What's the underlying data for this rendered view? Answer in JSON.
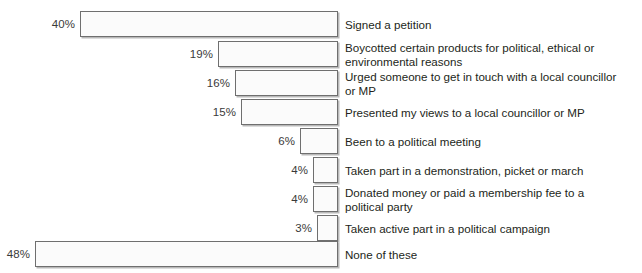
{
  "chart_data": {
    "type": "bar",
    "orientation": "horizontal",
    "title": "",
    "subtitle": "",
    "xlabel": "",
    "ylabel": "",
    "grid": false,
    "legend": false,
    "value_suffix": "%",
    "xlim": [
      0,
      48
    ],
    "categories": [
      "Signed a petition",
      "Boycotted certain products for political, ethical or\nenvironmental reasons",
      "Urged someone to get in touch with a local councillor\nor MP",
      "Presented my views to a local councillor or MP",
      "Been to a political meeting",
      "Taken part in a demonstration, picket or march",
      "Donated money or paid a membership fee to a\npolitical party",
      "Taken active part in a political campaign",
      "None of these"
    ],
    "values": [
      40,
      19,
      16,
      15,
      6,
      4,
      4,
      3,
      48
    ],
    "value_labels": [
      "40%",
      "19%",
      "16%",
      "15%",
      "6%",
      "4%",
      "4%",
      "3%",
      "48%"
    ],
    "bars": [
      {
        "label": "Signed a petition",
        "value": 40,
        "value_label": "40%",
        "top": 11,
        "left": 80,
        "width": 258
      },
      {
        "label": "Boycotted certain products for political, ethical or\nenvironmental reasons",
        "value": 19,
        "value_label": "19%",
        "top": 41,
        "left": 218,
        "width": 120
      },
      {
        "label": "Urged someone to get in touch with a local councillor\nor MP",
        "value": 16,
        "value_label": "16%",
        "top": 70,
        "left": 235,
        "width": 103
      },
      {
        "label": "Presented my views to a local councillor or MP",
        "value": 15,
        "value_label": "15%",
        "top": 99,
        "left": 241,
        "width": 97
      },
      {
        "label": "Been to a political meeting",
        "value": 6,
        "value_label": "6%",
        "top": 128,
        "left": 300,
        "width": 38
      },
      {
        "label": "Taken part in a demonstration, picket or march",
        "value": 4,
        "value_label": "4%",
        "top": 157,
        "left": 313,
        "width": 25
      },
      {
        "label": "Donated money or paid a membership fee to a\npolitical party",
        "value": 4,
        "value_label": "4%",
        "top": 186,
        "left": 313,
        "width": 25
      },
      {
        "label": "Taken active part in a political campaign",
        "value": 3,
        "value_label": "3%",
        "top": 215,
        "left": 317,
        "width": 21
      },
      {
        "label": "None of these",
        "value": 48,
        "value_label": "48%",
        "top": 241,
        "left": 35,
        "width": 303
      }
    ],
    "colors": {
      "bar_fill": "#fbfbfb",
      "bar_border": "#6f6f6f",
      "bar_shadow": "#b9b9b9",
      "label_text": "#231f20",
      "value_text": "#3a3a3a",
      "background": "#ffffff"
    }
  }
}
